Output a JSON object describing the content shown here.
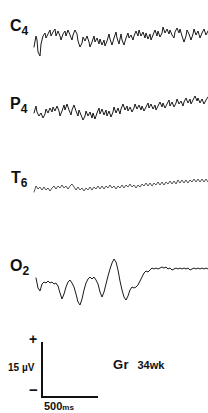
{
  "figure": {
    "type": "eeg-recording",
    "width": 208,
    "height": 413,
    "background": "#ffffff",
    "ink_color": "#1a1a1a"
  },
  "channels": [
    {
      "id": "C4",
      "letter": "C",
      "subscript": "4",
      "label_full": "C4",
      "baseline_y": 38,
      "description": "right central derivation, continuous mixed-frequency activity"
    },
    {
      "id": "P4",
      "letter": "P",
      "subscript": "4",
      "label_full": "P4",
      "baseline_y": 114,
      "description": "right parietal derivation, moderate amplitude rhythmic activity"
    },
    {
      "id": "T6",
      "letter": "T",
      "subscript": "6",
      "label_full": "T6",
      "baseline_y": 188,
      "description": "right posterior temporal derivation, low amplitude fast activity"
    },
    {
      "id": "O2",
      "letter": "O",
      "subscript": "2",
      "label_full": "O2",
      "baseline_y": 278,
      "description": "right occipital derivation, large slow waves"
    }
  ],
  "calibration": {
    "amplitude_label": "15 µV",
    "amplitude_value": 15,
    "amplitude_unit": "µV",
    "time_label": "500",
    "time_unit": "ms",
    "time_value": 500,
    "polarity_positive": "+",
    "polarity_negative": "−"
  },
  "subject": {
    "name": "Gr",
    "age_label": "34wk",
    "age_value": 34,
    "age_unit": "wk"
  },
  "chart_data": {
    "type": "line",
    "title": "",
    "xlabel": "",
    "ylabel": "",
    "grid": false,
    "legend": "none",
    "x_scale_bar_ms": 500,
    "y_scale_bar_uv": 15,
    "series": [
      {
        "name": "C4",
        "points": "M34,47 L36,36 L37,40 L38,52 L40,56 L41,44 L43,36 L45,33 L46,38 L48,34 L50,30 L51,36 L53,32 L55,29 L56,36 L58,31 L60,36 L61,40 L63,34 L65,31 L66,36 L68,30 L70,35 L72,40 L73,35 L75,30 L77,34 L78,41 L80,47 L82,43 L83,37 L85,41 L87,36 L89,42 L90,47 L92,42 L94,36 L95,42 L97,38 L99,44 L100,39 L102,45 L104,40 L105,46 L107,41 L109,34 L110,39 L112,45 L114,38 L116,32 L117,38 L119,44 L121,34 L122,40 L124,45 L126,38 L128,33 L129,38 L131,35 L133,40 L134,36 L136,31 L138,36 L139,30 L141,36 L143,32 L145,38 L146,33 L148,39 L150,34 L151,40 L153,35 L155,30 L157,36 L158,31 L160,37 L162,33 L163,27 L165,33 L167,29 L169,34 L170,30 L172,35 L174,38 L175,32 L177,28 L179,33 L180,29 L182,36 L184,42 L186,36 L187,30 L189,34 L191,40 L193,34 L194,29 L196,35 L198,31 L200,38 L202,33 L204,29 L206,35 L208,31"
      },
      {
        "name": "P4",
        "points": "M34,113 L36,106 L37,112 L39,116 L41,113 L43,118 L45,114 L46,109 L48,113 L50,108 L52,112 L53,107 L55,111 L57,106 L59,111 L60,116 L62,111 L64,105 L65,110 L67,104 L69,110 L71,115 L72,110 L74,105 L76,111 L78,116 L79,110 L81,115 L83,120 L85,116 L86,111 L88,116 L90,112 L92,118 L93,113 L95,119 L97,113 L99,108 L100,114 L102,109 L104,115 L106,110 L107,116 L109,111 L111,117 L113,112 L114,107 L116,113 L118,108 L120,114 L121,109 L123,104 L125,110 L127,106 L128,111 L130,107 L132,112 L134,108 L135,104 L137,109 L139,105 L141,110 L142,106 L144,111 L146,107 L148,103 L149,108 L151,104 L153,109 L155,105 L156,110 L158,106 L160,102 L162,107 L163,103 L165,108 L167,104 L169,100 L170,106 L172,102 L174,107 L176,103 L177,99 L179,104 L181,101 L183,106 L184,102 L186,98 L188,103 L190,99 L191,104 L193,100 L195,96 L197,101 L198,98 L200,103 L202,99 L204,104 L206,100 L208,97"
      },
      {
        "name": "T6",
        "points": "M34,192 L36,186 L38,189 L40,187 L42,190 L44,187 L46,190 L48,188 L50,191 L52,188 L54,186 L56,189 L58,186 L60,188 L62,185 L64,188 L66,186 L68,189 L70,186 L72,184 L74,187 L76,190 L78,187 L80,190 L82,188 L84,191 L86,188 L88,190 L90,187 L92,190 L94,187 L96,189 L98,186 L100,189 L102,186 L104,189 L106,186 L108,188 L110,185 L112,188 L114,186 L116,189 L118,186 L120,188 L122,185 L124,188 L126,185 L128,187 L130,184 L132,187 L134,185 L136,188 L138,185 L140,187 L142,184 L144,186 L146,183 L148,186 L150,183 L152,186 L154,183 L156,185 L158,182 L160,185 L162,182 L164,185 L166,182 L168,184 L170,181 L172,184 L174,181 L176,184 L178,180 L180,183 L182,180 L184,183 L186,180 L188,183 L190,180 L192,182 L194,179 L196,182 L198,179 L200,182 L202,179 L204,182 L206,179 L208,182"
      },
      {
        "name": "O2",
        "points": "M36,278 L38,288 L40,291 L42,284 L44,282 L46,283 L48,281 L50,283 L52,282 L54,284 L56,283 L58,286 L60,293 L62,299 L64,294 L66,287 L68,282 L70,280 L72,283 L74,287 L76,294 L78,302 L80,305 L82,299 L84,290 L86,283 L88,279 L90,277 L92,279 L94,277 L96,280 L98,284 L100,292 L102,297 L104,292 L106,284 L108,276 L110,269 L112,263 L114,259 L116,262 L118,270 L120,281 L122,290 L124,297 L126,300 L128,296 L130,290 L132,287 L134,288 L136,287 L138,285 L140,281 L142,277 L144,273 L146,271 L148,272 L150,270 L152,268 L154,269 L156,268 L158,269 L160,268 L162,267 L164,268 L166,267 L168,269 L170,268 L172,270 L174,269 L176,268 L178,269 L180,268 L182,269 L184,268 L186,269 L188,268 L190,270 L192,269 L194,268 L196,269 L198,268 L200,269 L202,268 L204,269 L206,268 L208,269"
      }
    ]
  }
}
